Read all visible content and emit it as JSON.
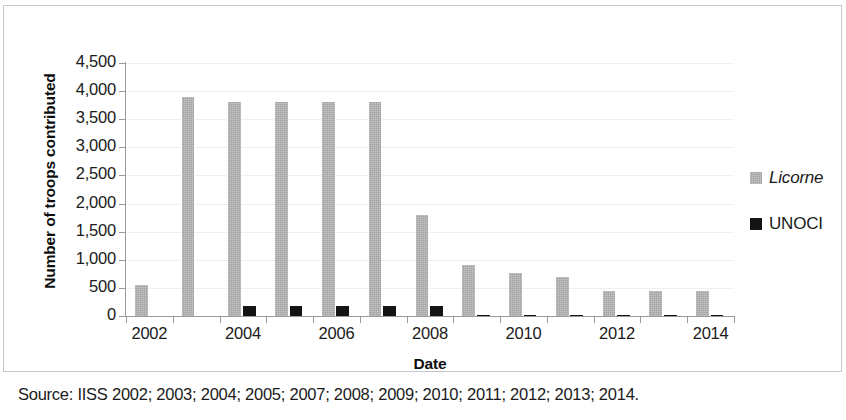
{
  "figure": {
    "source_caption": "Source: IISS 2002; 2003; 2004; 2005; 2007; 2008; 2009; 2010; 2011; 2012; 2013; 2014."
  },
  "legend": {
    "position": "right",
    "entries": [
      {
        "label": "Licorne",
        "color": "#b4b4b4",
        "style": "italic"
      },
      {
        "label": "UNOCI",
        "color": "#141414",
        "style": "normal"
      }
    ]
  },
  "chart_data": {
    "type": "bar",
    "title": "",
    "subtitle": "",
    "xlabel": "Date",
    "ylabel": "Number of troops contributed",
    "categories": [
      "2002",
      "2003",
      "2004",
      "2005",
      "2006",
      "2007",
      "2008",
      "2009",
      "2010",
      "2011",
      "2012",
      "2013",
      "2014"
    ],
    "tick_labels_x": [
      "2002",
      "2004",
      "2006",
      "2008",
      "2010",
      "2012",
      "2014"
    ],
    "tick_labels_y": [
      "0",
      "500",
      "1,000",
      "1,500",
      "2,000",
      "2,500",
      "3,000",
      "3,500",
      "4,000",
      "4,500"
    ],
    "ylim": [
      0,
      4500
    ],
    "ytick_step": 500,
    "grid": true,
    "series": [
      {
        "name": "Licorne",
        "color": "#b4b4b4",
        "values": [
          550,
          3900,
          3800,
          3800,
          3800,
          3800,
          1800,
          900,
          770,
          700,
          450,
          440,
          450
        ]
      },
      {
        "name": "UNOCI",
        "color": "#141414",
        "values": [
          0,
          0,
          175,
          175,
          175,
          175,
          175,
          25,
          25,
          25,
          25,
          20,
          20
        ]
      }
    ]
  }
}
